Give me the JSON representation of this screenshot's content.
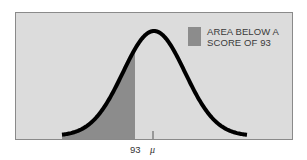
{
  "chart_data": {
    "type": "area",
    "title": "",
    "xlabel": "",
    "ylabel": "",
    "x_ticks": [
      {
        "label": "93",
        "position": "score"
      },
      {
        "label": "μ",
        "position": "mean"
      }
    ],
    "curve": {
      "distribution": "normal",
      "mean_label": "μ",
      "shaded_region": {
        "from": "-inf",
        "to": 93,
        "label": "AREA BELOW A SCORE OF 93"
      }
    },
    "legend": [
      {
        "label_line1": "AREA BELOW A",
        "label_line2": "SCORE OF 93",
        "color": "#8c8c8c"
      }
    ],
    "grid": false,
    "legend_position": "top-right"
  },
  "colors": {
    "background": "#dcdcdc",
    "frame": "#8a8a8a",
    "curve": "#000000",
    "shaded": "#8c8c8c"
  },
  "labels": {
    "legend_line1": "AREA BELOW A",
    "legend_line2": "SCORE OF 93",
    "score_tick": "93",
    "mean_tick": "μ"
  }
}
